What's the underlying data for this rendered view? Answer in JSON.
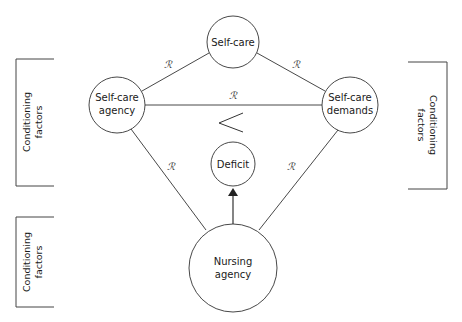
{
  "diagram": {
    "type": "concept-model",
    "nodes": {
      "self_care": {
        "label_lines": [
          "Self-care"
        ]
      },
      "self_care_agency": {
        "label_lines": [
          "Self-care",
          "agency"
        ]
      },
      "self_care_demands": {
        "label_lines": [
          "Self-care",
          "demands"
        ]
      },
      "deficit": {
        "label_lines": [
          "Deficit"
        ]
      },
      "nursing_agency": {
        "label_lines": [
          "Nursing",
          "agency"
        ]
      }
    },
    "relation_symbol": "ℛ",
    "comparison_symbol": "<",
    "edges": [
      {
        "from": "self_care_agency",
        "to": "self_care",
        "label": "ℛ"
      },
      {
        "from": "self_care",
        "to": "self_care_demands",
        "label": "ℛ"
      },
      {
        "from": "self_care_agency",
        "to": "self_care_demands",
        "label": "ℛ"
      },
      {
        "from": "self_care_agency",
        "to": "nursing_agency",
        "label": "ℛ"
      },
      {
        "from": "self_care_demands",
        "to": "nursing_agency",
        "label": "ℛ"
      },
      {
        "from": "nursing_agency",
        "to": "deficit",
        "label": "",
        "arrow": true
      }
    ],
    "conditioning": {
      "left_top": {
        "lines": [
          "Conditioning",
          "factors"
        ]
      },
      "left_bottom": {
        "lines": [
          "Conditioning",
          "factors"
        ]
      },
      "right": {
        "lines": [
          "Conditioning",
          "factors"
        ]
      }
    }
  }
}
